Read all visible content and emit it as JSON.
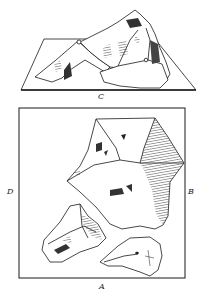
{
  "figure": {
    "labels": {
      "top_view": "C",
      "left": "D",
      "right": "B",
      "bottom": "A"
    },
    "colors": {
      "ink": "#1a1a1a",
      "paper": "#ffffff",
      "hatch": "#444444"
    }
  }
}
